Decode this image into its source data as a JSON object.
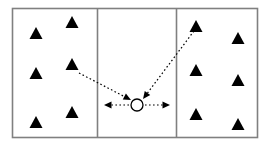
{
  "diagram": {
    "canvas": {
      "width": 270,
      "height": 147,
      "background": "#ffffff"
    },
    "frame": {
      "name": "outer-rectangle",
      "x": 12.5,
      "y": 8.5,
      "width": 245,
      "height": 129,
      "stroke": "#808080",
      "stroke_width": 1.6,
      "fill": "#ffffff"
    },
    "dividers": [
      {
        "name": "left-divider",
        "x": 97.5,
        "y1": 8.5,
        "y2": 137.5,
        "stroke": "#808080",
        "stroke_width": 1.6
      },
      {
        "name": "right-divider",
        "x": 176.5,
        "y1": 8.5,
        "y2": 137.5,
        "stroke": "#808080",
        "stroke_width": 1.6
      }
    ],
    "panels": [
      {
        "name": "left-panel",
        "label": "left zone",
        "x": 12.5,
        "width": 85
      },
      {
        "name": "middle-panel",
        "label": "middle zone",
        "x": 97.5,
        "width": 79
      },
      {
        "name": "right-panel",
        "label": "right zone",
        "x": 176.5,
        "width": 81
      }
    ],
    "triangle": {
      "fill": "#000000",
      "half_width": 6.5,
      "height": 12
    },
    "triangles": [
      {
        "name": "triangle-left-1",
        "panel": "left",
        "cx": 36,
        "cy": 39
      },
      {
        "name": "triangle-left-2",
        "panel": "left",
        "cx": 72,
        "cy": 28
      },
      {
        "name": "triangle-left-3",
        "panel": "left",
        "cx": 36,
        "cy": 79
      },
      {
        "name": "triangle-left-4",
        "panel": "left",
        "cx": 72,
        "cy": 70
      },
      {
        "name": "triangle-left-5",
        "panel": "left",
        "cx": 36,
        "cy": 128
      },
      {
        "name": "triangle-left-6",
        "panel": "left",
        "cx": 72,
        "cy": 118
      },
      {
        "name": "triangle-right-1",
        "panel": "right",
        "cx": 196,
        "cy": 32
      },
      {
        "name": "triangle-right-2",
        "panel": "right",
        "cx": 238,
        "cy": 44
      },
      {
        "name": "triangle-right-3",
        "panel": "right",
        "cx": 196,
        "cy": 76
      },
      {
        "name": "triangle-right-4",
        "panel": "right",
        "cx": 238,
        "cy": 86
      },
      {
        "name": "triangle-right-5",
        "panel": "right",
        "cx": 196,
        "cy": 120
      },
      {
        "name": "triangle-right-6",
        "panel": "right",
        "cx": 238,
        "cy": 130
      }
    ],
    "node": {
      "name": "center-node",
      "shape": "circle",
      "cx": 137,
      "cy": 105,
      "r": 6,
      "fill": "#ffffff",
      "stroke": "#000000",
      "stroke_width": 1.3
    },
    "arrows": [
      {
        "name": "arrow-left-horizontal",
        "direction": "left",
        "style": "dotted",
        "x1": 129,
        "y1": 105,
        "x2": 104,
        "y2": 105,
        "stroke": "#000000",
        "stroke_width": 1.2,
        "dash": "1.6 2.4"
      },
      {
        "name": "arrow-right-horizontal",
        "direction": "right",
        "style": "dotted",
        "x1": 145,
        "y1": 105,
        "x2": 170,
        "y2": 105,
        "stroke": "#000000",
        "stroke_width": 1.2,
        "dash": "1.6 2.4"
      },
      {
        "name": "arrow-from-left-triangle",
        "direction": "down-right-into-node",
        "style": "dotted",
        "x1": 79,
        "y1": 73,
        "x2": 131,
        "y2": 100,
        "stroke": "#000000",
        "stroke_width": 1.2,
        "dash": "1.6 2.4"
      },
      {
        "name": "arrow-from-right-triangle",
        "direction": "down-left-into-node",
        "style": "dotted",
        "x1": 194,
        "y1": 31,
        "x2": 143,
        "y2": 99,
        "stroke": "#000000",
        "stroke_width": 1.2,
        "dash": "1.6 2.4"
      }
    ],
    "arrowhead": {
      "length": 7.5,
      "half_width": 3.4,
      "fill": "#000000"
    }
  }
}
